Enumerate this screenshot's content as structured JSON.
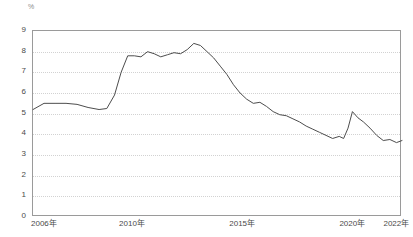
{
  "chart_data": {
    "type": "line",
    "title": "",
    "subtitle": "",
    "xlabel": "",
    "ylabel": "%",
    "unit_label": "%",
    "ylim": [
      0,
      9
    ],
    "yticks": [
      0,
      1,
      2,
      3,
      4,
      5,
      6,
      7,
      8,
      9
    ],
    "ytick_labels": [
      "0",
      "1",
      "2",
      "3",
      "4",
      "5",
      "6",
      "7",
      "8",
      "9"
    ],
    "xlim": [
      2006,
      2022.75
    ],
    "xtick_positions": [
      2006,
      2010,
      2015,
      2020,
      2022
    ],
    "xtick_labels": [
      "2006年",
      "2010年",
      "2015年",
      "2020年",
      "2022年"
    ],
    "grid": true,
    "grid_axis": "y",
    "legend": false,
    "legend_position": "none",
    "line_color": "#4d4d4d",
    "grid_color": "#d2d2d2",
    "axis_color": "#9a9a9a",
    "series": [
      {
        "name": "",
        "x": [
          2006.0,
          2006.5,
          2007.0,
          2007.5,
          2008.0,
          2008.5,
          2009.0,
          2009.35,
          2009.7,
          2010.0,
          2010.3,
          2010.6,
          2010.9,
          2011.2,
          2011.5,
          2011.8,
          2012.1,
          2012.4,
          2012.7,
          2013.0,
          2013.3,
          2013.6,
          2013.9,
          2014.2,
          2014.5,
          2014.8,
          2015.1,
          2015.4,
          2015.7,
          2016.0,
          2016.3,
          2016.6,
          2016.9,
          2017.2,
          2017.5,
          2017.8,
          2018.1,
          2018.4,
          2018.7,
          2019.0,
          2019.3,
          2019.6,
          2019.9,
          2020.1,
          2020.3,
          2020.5,
          2020.75,
          2021.0,
          2021.3,
          2021.6,
          2021.9,
          2022.2,
          2022.5,
          2022.75
        ],
        "values": [
          5.2,
          5.5,
          5.5,
          5.5,
          5.45,
          5.3,
          5.2,
          5.25,
          5.9,
          7.0,
          7.8,
          7.8,
          7.75,
          8.0,
          7.9,
          7.75,
          7.85,
          7.95,
          7.9,
          8.1,
          8.4,
          8.3,
          8.0,
          7.7,
          7.3,
          6.9,
          6.4,
          6.0,
          5.7,
          5.5,
          5.55,
          5.35,
          5.1,
          4.95,
          4.9,
          4.75,
          4.6,
          4.4,
          4.25,
          4.1,
          3.95,
          3.8,
          3.9,
          3.8,
          4.3,
          5.1,
          4.8,
          4.6,
          4.3,
          3.95,
          3.7,
          3.75,
          3.6,
          3.7
        ]
      }
    ]
  }
}
